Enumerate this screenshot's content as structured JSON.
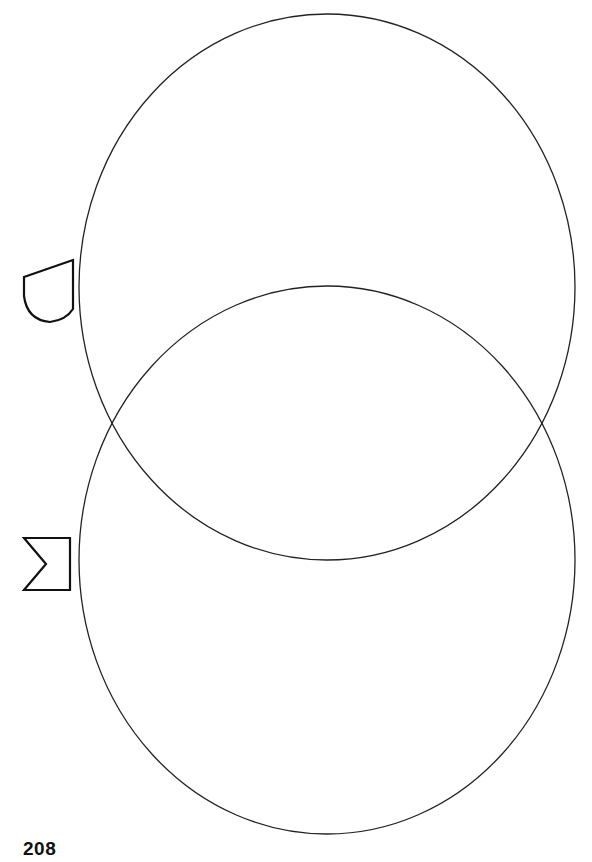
{
  "page": {
    "number": "208"
  },
  "venn": {
    "circles": [
      {
        "name": "top-circle",
        "cx": 327,
        "cy": 287,
        "rx": 248,
        "ry": 273
      },
      {
        "name": "bottom-circle",
        "cx": 327,
        "cy": 560,
        "rx": 248,
        "ry": 274
      }
    ],
    "stroke_color": "#222222"
  },
  "labels": [
    {
      "icon": "half-rounded-shape-icon",
      "position": "top-circle"
    },
    {
      "icon": "notched-flag-shape-icon",
      "position": "bottom-circle"
    }
  ]
}
